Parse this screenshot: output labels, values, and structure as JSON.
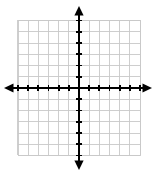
{
  "figure": {
    "kind": "blank-coordinate-grid",
    "title": "",
    "background_color": "#ffffff"
  },
  "chart_data": {
    "type": "scatter",
    "title": "",
    "subtitle": "",
    "xlabel": "",
    "ylabel": "",
    "xlim": [
      -6,
      6
    ],
    "ylim": [
      -6,
      6
    ],
    "x": [],
    "y": [],
    "series": [],
    "annotations": [],
    "legend": {
      "entries": [],
      "position": "none"
    },
    "grid": {
      "visible": true,
      "columns": 12,
      "rows": 12,
      "cell_size_units": 1,
      "x_gridlines": [
        -6,
        -5,
        -4,
        -3,
        -2,
        -1,
        0,
        1,
        2,
        3,
        4,
        5,
        6
      ],
      "y_gridlines": [
        -6,
        -5,
        -4,
        -3,
        -2,
        -1,
        0,
        1,
        2,
        3,
        4,
        5,
        6
      ],
      "color": "#c9c9c9"
    },
    "axes": {
      "color": "#000000",
      "x_axis": {
        "position_y": 0,
        "arrow_left": true,
        "arrow_right": true,
        "tick_values": [
          -6,
          -5,
          -4,
          -3,
          -2,
          -1,
          1,
          2,
          3,
          4,
          5,
          6
        ],
        "tick_labels": [],
        "labeled": false
      },
      "y_axis": {
        "position_x": 0,
        "arrow_up": true,
        "arrow_down": true,
        "tick_values": [
          -6,
          -5,
          -4,
          -3,
          -2,
          -1,
          1,
          2,
          3,
          4,
          5,
          6
        ],
        "tick_labels": [],
        "labeled": false
      }
    }
  },
  "geometry": {
    "grid_left_px": 18,
    "grid_top_px": 20,
    "grid_right_px": 140,
    "grid_bottom_px": 155,
    "origin_x_px": 79,
    "origin_y_px": 88,
    "step_x_px": 10.1667,
    "step_y_px": 11.25,
    "x_arrow_left_px": 4,
    "x_arrow_right_px": 152,
    "y_arrow_top_px": 6,
    "y_arrow_bottom_px": 170,
    "tick_half_len_px": 3.2
  }
}
